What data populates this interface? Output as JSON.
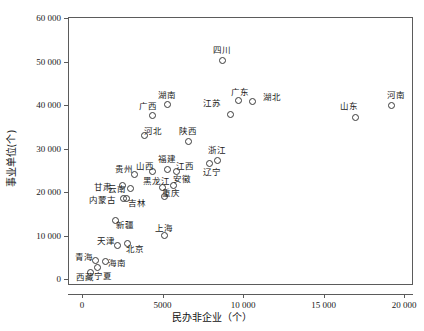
{
  "chart_data": {
    "type": "scatter",
    "title": "",
    "xlabel": "民办非企业（个）",
    "ylabel": "事业单位(个)",
    "xlim": [
      -1200,
      21300
    ],
    "ylim": [
      -1000,
      61500
    ],
    "grid": false,
    "legend": "none",
    "xticks": [
      {
        "value": 0,
        "label": "0"
      },
      {
        "value": 5000,
        "label": "5000"
      },
      {
        "value": 10000,
        "label": "10 000"
      },
      {
        "value": 15000,
        "label": "15 000"
      },
      {
        "value": 20000,
        "label": "20 000"
      }
    ],
    "yticks": [
      {
        "value": 0,
        "label": "0"
      },
      {
        "value": 10000,
        "label": "10 000"
      },
      {
        "value": 20000,
        "label": "20 000"
      },
      {
        "value": 30000,
        "label": "30 000"
      },
      {
        "value": 40000,
        "label": "40 000"
      },
      {
        "value": 50000,
        "label": "50 000"
      },
      {
        "value": 60000,
        "label": "60 000"
      }
    ],
    "points": [
      {
        "label": "四川",
        "x": 8700,
        "y": 50200,
        "lx": 8700,
        "ly": 52600
      },
      {
        "label": "湖南",
        "x": 5300,
        "y": 40100,
        "lx": 5300,
        "ly": 42400
      },
      {
        "label": "广西",
        "x": 4350,
        "y": 37600,
        "lx": 4100,
        "ly": 39700
      },
      {
        "label": "广东",
        "x": 9700,
        "y": 41000,
        "lx": 9800,
        "ly": 43000
      },
      {
        "label": "湖北",
        "x": 10600,
        "y": 40800,
        "lx": 11800,
        "ly": 41900
      },
      {
        "label": "江苏",
        "x": 9200,
        "y": 37800,
        "lx": 8100,
        "ly": 40400
      },
      {
        "label": "河南",
        "x": 19200,
        "y": 39900,
        "lx": 19500,
        "ly": 42300
      },
      {
        "label": "山东",
        "x": 17000,
        "y": 37200,
        "lx": 16600,
        "ly": 39800
      },
      {
        "label": "河北",
        "x": 3900,
        "y": 33000,
        "lx": 4400,
        "ly": 34100
      },
      {
        "label": "陕西",
        "x": 6600,
        "y": 31700,
        "lx": 6600,
        "ly": 34000
      },
      {
        "label": "浙江",
        "x": 8400,
        "y": 27300,
        "lx": 8400,
        "ly": 29700
      },
      {
        "label": "辽宁",
        "x": 7900,
        "y": 26500,
        "lx": 8100,
        "ly": 24600
      },
      {
        "label": "福建",
        "x": 5300,
        "y": 25200,
        "lx": 5300,
        "ly": 27600
      },
      {
        "label": "江西",
        "x": 5850,
        "y": 24700,
        "lx": 6400,
        "ly": 26000
      },
      {
        "label": "山西",
        "x": 4400,
        "y": 24600,
        "lx": 3900,
        "ly": 26000
      },
      {
        "label": "贵州",
        "x": 3250,
        "y": 24000,
        "lx": 2600,
        "ly": 25400
      },
      {
        "label": "安徽",
        "x": 5700,
        "y": 21600,
        "lx": 6200,
        "ly": 22900
      },
      {
        "label": "黑龙江",
        "x": 5000,
        "y": 21100,
        "lx": 4600,
        "ly": 22600
      },
      {
        "label": "云南",
        "x": 3000,
        "y": 20800,
        "lx": 2200,
        "ly": 20700
      },
      {
        "label": "甘肃",
        "x": 2500,
        "y": 21600,
        "lx": 1300,
        "ly": 21100
      },
      {
        "label": "重庆",
        "x": 5100,
        "y": 19000,
        "lx": 5500,
        "ly": 19800
      },
      {
        "label": "吉林",
        "x": 2750,
        "y": 18400,
        "lx": 3400,
        "ly": 17500
      },
      {
        "label": "内蒙古",
        "x": 2550,
        "y": 18600,
        "lx": 1250,
        "ly": 18100
      },
      {
        "label": "新疆",
        "x": 2100,
        "y": 13500,
        "lx": 2700,
        "ly": 12500
      },
      {
        "label": "上海",
        "x": 5100,
        "y": 10100,
        "lx": 5100,
        "ly": 11800
      },
      {
        "label": "北京",
        "x": 2800,
        "y": 8200,
        "lx": 3300,
        "ly": 7000
      },
      {
        "label": "天津",
        "x": 2200,
        "y": 7700,
        "lx": 1500,
        "ly": 8800
      },
      {
        "label": "海南",
        "x": 1450,
        "y": 4100,
        "lx": 2200,
        "ly": 3700
      },
      {
        "label": "青海",
        "x": 850,
        "y": 4300,
        "lx": 100,
        "ly": 5000
      },
      {
        "label": "宁夏",
        "x": 950,
        "y": 2600,
        "lx": 1300,
        "ly": 700
      },
      {
        "label": "西藏",
        "x": 500,
        "y": 1600,
        "lx": 200,
        "ly": 400
      }
    ]
  }
}
